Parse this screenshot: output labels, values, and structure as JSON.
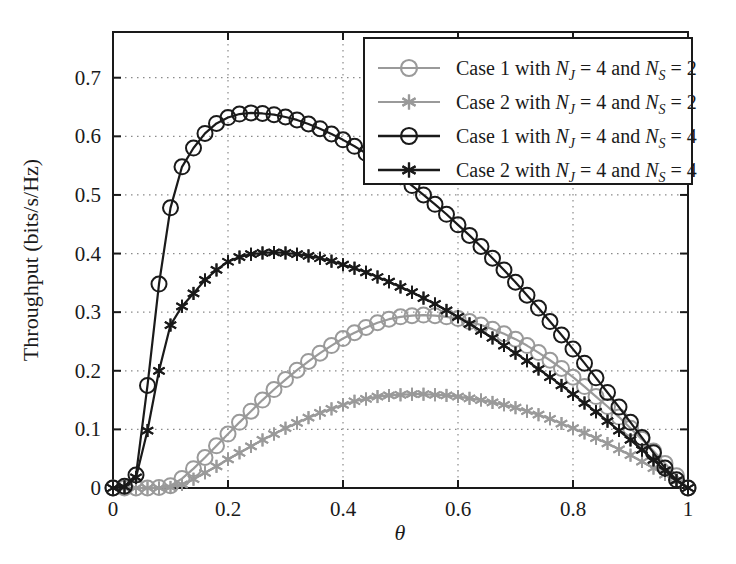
{
  "chart_data": {
    "type": "line",
    "title": "",
    "xlabel": "θ",
    "ylabel": "Throughput (bits/s/Hz)",
    "xlim": [
      0,
      1
    ],
    "ylim": [
      0,
      0.778
    ],
    "grid": true,
    "grid_style": "dotted",
    "legend_position": "top-right",
    "xticks": [
      0,
      0.2,
      0.4,
      0.6,
      0.8,
      1
    ],
    "xticklabels": [
      "0",
      "0.2",
      "0.4",
      "0.6",
      "0.8",
      "1"
    ],
    "yticks": [
      0,
      0.1,
      0.2,
      0.3,
      0.4,
      0.5,
      0.6,
      0.7
    ],
    "yticklabels": [
      "0",
      "0.1",
      "0.2",
      "0.3",
      "0.4",
      "0.5",
      "0.6",
      "0.7"
    ],
    "x": [
      0.0,
      0.02,
      0.04,
      0.06,
      0.08,
      0.1,
      0.12,
      0.14,
      0.16,
      0.18,
      0.2,
      0.22,
      0.24,
      0.26,
      0.28,
      0.3,
      0.32,
      0.34,
      0.36,
      0.38,
      0.4,
      0.42,
      0.44,
      0.46,
      0.48,
      0.5,
      0.52,
      0.54,
      0.56,
      0.58,
      0.6,
      0.62,
      0.64,
      0.66,
      0.68,
      0.7,
      0.72,
      0.74,
      0.76,
      0.78,
      0.8,
      0.82,
      0.84,
      0.86,
      0.88,
      0.9,
      0.92,
      0.94,
      0.96,
      0.98,
      1.0
    ],
    "series": [
      {
        "name": "Case 1 with N_J = 4 and N_S = 2",
        "label_prefix": "Case 1 with",
        "marker": "circle",
        "color": "#9a9a9a",
        "peak_value": 0.295,
        "peak_x": 0.45,
        "values": [
          0.0,
          0.0,
          0.0,
          0.0,
          0.001,
          0.004,
          0.016,
          0.033,
          0.052,
          0.072,
          0.092,
          0.112,
          0.131,
          0.15,
          0.168,
          0.185,
          0.201,
          0.216,
          0.23,
          0.243,
          0.255,
          0.265,
          0.274,
          0.282,
          0.288,
          0.292,
          0.294,
          0.295,
          0.294,
          0.292,
          0.289,
          0.284,
          0.278,
          0.271,
          0.263,
          0.254,
          0.243,
          0.231,
          0.218,
          0.204,
          0.189,
          0.173,
          0.156,
          0.139,
          0.121,
          0.102,
          0.083,
          0.063,
          0.042,
          0.021,
          0.0
        ]
      },
      {
        "name": "Case 2 with N_J = 4 and N_S = 2",
        "label_prefix": "Case 2 with",
        "marker": "star",
        "color": "#9a9a9a",
        "peak_value": 0.16,
        "peak_x": 0.47,
        "values": [
          0.0,
          0.0,
          0.0,
          0.0,
          0.0,
          0.001,
          0.006,
          0.015,
          0.026,
          0.037,
          0.049,
          0.06,
          0.071,
          0.082,
          0.092,
          0.102,
          0.111,
          0.12,
          0.128,
          0.135,
          0.142,
          0.148,
          0.152,
          0.156,
          0.158,
          0.159,
          0.16,
          0.16,
          0.159,
          0.158,
          0.156,
          0.153,
          0.15,
          0.146,
          0.142,
          0.137,
          0.131,
          0.125,
          0.118,
          0.11,
          0.102,
          0.094,
          0.085,
          0.076,
          0.066,
          0.056,
          0.045,
          0.034,
          0.023,
          0.012,
          0.0
        ]
      },
      {
        "name": "Case 1 with N_J = 4 and N_S = 4",
        "label_prefix": "Case 1 with",
        "marker": "circle",
        "color": "#1a1a1a",
        "peak_value": 0.64,
        "peak_x": 0.23,
        "values": [
          0.0,
          0.003,
          0.022,
          0.175,
          0.348,
          0.478,
          0.548,
          0.58,
          0.605,
          0.622,
          0.632,
          0.638,
          0.64,
          0.639,
          0.637,
          0.633,
          0.628,
          0.621,
          0.613,
          0.604,
          0.594,
          0.583,
          0.571,
          0.558,
          0.545,
          0.531,
          0.516,
          0.5,
          0.484,
          0.467,
          0.449,
          0.431,
          0.412,
          0.392,
          0.372,
          0.351,
          0.329,
          0.307,
          0.284,
          0.261,
          0.237,
          0.213,
          0.188,
          0.163,
          0.138,
          0.112,
          0.086,
          0.06,
          0.034,
          0.014,
          0.0
        ]
      },
      {
        "name": "Case 2 with N_J = 4 and N_S = 4",
        "label_prefix": "Case 2 with",
        "marker": "star",
        "color": "#1a1a1a",
        "peak_value": 0.402,
        "peak_x": 0.245,
        "values": [
          0.0,
          0.002,
          0.018,
          0.098,
          0.2,
          0.278,
          0.31,
          0.332,
          0.355,
          0.372,
          0.386,
          0.394,
          0.399,
          0.401,
          0.402,
          0.401,
          0.399,
          0.396,
          0.392,
          0.387,
          0.381,
          0.375,
          0.368,
          0.36,
          0.352,
          0.343,
          0.334,
          0.324,
          0.314,
          0.303,
          0.292,
          0.28,
          0.268,
          0.256,
          0.243,
          0.23,
          0.217,
          0.203,
          0.189,
          0.175,
          0.16,
          0.145,
          0.13,
          0.114,
          0.098,
          0.082,
          0.065,
          0.048,
          0.03,
          0.013,
          0.0
        ]
      }
    ]
  },
  "legend": {
    "entries": [
      {
        "prefix": "Case 1 with",
        "var1": "N",
        "sub1": "J",
        "eq1": "= 4 and",
        "var2": "N",
        "sub2": "S",
        "eq2": "= 2",
        "marker": "circle",
        "color": "#9a9a9a"
      },
      {
        "prefix": "Case 2 with",
        "var1": "N",
        "sub1": "J",
        "eq1": "= 4 and",
        "var2": "N",
        "sub2": "S",
        "eq2": "= 2",
        "marker": "star",
        "color": "#9a9a9a"
      },
      {
        "prefix": "Case 1 with",
        "var1": "N",
        "sub1": "J",
        "eq1": "= 4 and",
        "var2": "N",
        "sub2": "S",
        "eq2": "= 4",
        "marker": "circle",
        "color": "#1a1a1a"
      },
      {
        "prefix": "Case 2 with",
        "var1": "N",
        "sub1": "J",
        "eq1": "= 4 and",
        "var2": "N",
        "sub2": "S",
        "eq2": "= 4",
        "marker": "star",
        "color": "#1a1a1a"
      }
    ]
  },
  "axes": {
    "x_title": "θ",
    "y_title": "Throughput (bits/s/Hz)"
  },
  "colors": {
    "light_series": "#9a9a9a",
    "dark_series": "#1a1a1a",
    "axis": "#1a1a1a",
    "grid": "#8a8a8a",
    "background": "#ffffff"
  }
}
